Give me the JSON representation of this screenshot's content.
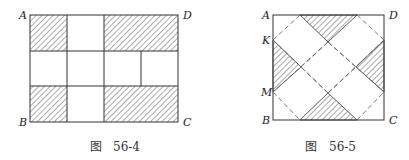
{
  "figures": [
    {
      "id": "fig-56-4",
      "caption_prefix": "图",
      "caption_number": "56-4",
      "vertex_labels": {
        "top_left": "A",
        "top_right": "D",
        "bottom_left": "B",
        "bottom_right": "C"
      },
      "description": "Rectangle ABCD divided into 3 rows; top and bottom rows have hatched left square and hatched right rectangle with white middle square; middle row has four white cells"
    },
    {
      "id": "fig-56-5",
      "caption_prefix": "图",
      "caption_number": "56-5",
      "vertex_labels": {
        "top_left": "A",
        "top_right": "D",
        "bottom_left": "B",
        "bottom_right": "C",
        "left_upper": "K",
        "left_lower": "M"
      },
      "description": "Square ABCD with dashed diagonal lattice forming a rotated square; four hatched triangles along the edges (top, left, right, bottom)"
    }
  ],
  "colors": {
    "stroke": "#333333",
    "hatch": "#444444",
    "dash": "#666666",
    "background": "#ffffff"
  }
}
